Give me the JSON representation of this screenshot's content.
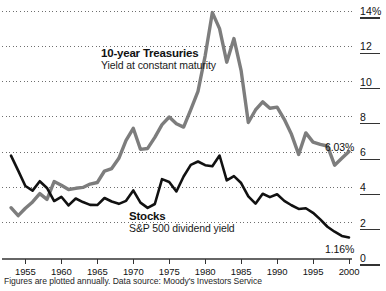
{
  "chart_data": {
    "type": "line",
    "title": "",
    "subtitle": "",
    "xlabel": "",
    "ylabel": "",
    "xlim": [
      1953,
      2000
    ],
    "ylim": [
      0,
      14
    ],
    "grid": true,
    "grid_style": "dotted-horizontal",
    "legend_position": "inline-annotations",
    "x_ticks": [
      1955,
      1960,
      1965,
      1970,
      1975,
      1980,
      1985,
      1990,
      1995,
      2000
    ],
    "x_tick_labels": [
      "1955",
      "1960",
      "1965",
      "1970",
      "1975",
      "1980",
      "1985",
      "1990",
      "1995",
      "2000"
    ],
    "y_ticks": [
      0,
      2,
      4,
      6,
      8,
      10,
      12,
      14
    ],
    "y_tick_labels": [
      "0",
      "2",
      "4",
      "6",
      "8",
      "10",
      "12",
      "14%"
    ],
    "x": [
      1953,
      1954,
      1955,
      1956,
      1957,
      1958,
      1959,
      1960,
      1961,
      1962,
      1963,
      1964,
      1965,
      1966,
      1967,
      1968,
      1969,
      1970,
      1971,
      1972,
      1973,
      1974,
      1975,
      1976,
      1977,
      1978,
      1979,
      1980,
      1981,
      1982,
      1983,
      1984,
      1985,
      1986,
      1987,
      1988,
      1989,
      1990,
      1991,
      1992,
      1993,
      1994,
      1995,
      1996,
      1997,
      1998,
      1999,
      2000
    ],
    "series": [
      {
        "name": "10-year Treasuries",
        "description": "Yield at constant maturity",
        "color": "#7d7d7d",
        "line_width": 3.4,
        "values": [
          2.85,
          2.4,
          2.82,
          3.18,
          3.65,
          3.32,
          4.33,
          4.12,
          3.88,
          3.95,
          4.0,
          4.19,
          4.28,
          4.93,
          5.07,
          5.65,
          6.67,
          7.35,
          6.16,
          6.21,
          6.84,
          7.56,
          7.99,
          7.61,
          7.42,
          8.41,
          9.44,
          11.46,
          13.91,
          13.0,
          11.1,
          12.44,
          10.62,
          7.68,
          8.39,
          8.85,
          8.49,
          8.55,
          7.86,
          7.01,
          5.87,
          7.09,
          6.57,
          6.44,
          6.35,
          5.26,
          5.65,
          6.03
        ]
      },
      {
        "name": "Stocks",
        "description": "S&P 500 dividend yield",
        "color": "#111111",
        "line_width": 2.6,
        "values": [
          5.8,
          4.95,
          4.08,
          3.82,
          4.35,
          3.97,
          3.23,
          3.47,
          2.98,
          3.37,
          3.17,
          3.01,
          3.0,
          3.4,
          3.2,
          3.07,
          3.24,
          3.83,
          3.14,
          2.84,
          3.06,
          4.47,
          4.31,
          3.77,
          4.62,
          5.28,
          5.47,
          5.26,
          5.2,
          5.81,
          4.4,
          4.64,
          4.25,
          3.49,
          3.08,
          3.64,
          3.45,
          3.61,
          3.24,
          2.99,
          2.78,
          2.82,
          2.56,
          2.19,
          1.77,
          1.49,
          1.25,
          1.16
        ]
      }
    ],
    "annotations": [
      {
        "name": "treasuries-end-value",
        "text": "6.03%",
        "x": 2000,
        "y": 6.03
      },
      {
        "name": "stocks-end-value",
        "text": "1.16%",
        "x": 2000,
        "y": 1.16
      }
    ]
  },
  "labels": {
    "treasuries_title": "10-year Treasuries",
    "treasuries_subtitle": "Yield at constant maturity",
    "stocks_title": "Stocks",
    "stocks_subtitle": "S&P 500 dividend yield",
    "treasuries_end": "6.03%",
    "stocks_end": "1.16%"
  },
  "axis": {
    "y_labels": [
      "14%",
      "12",
      "10",
      "8",
      "6",
      "4",
      "2",
      "0"
    ],
    "x_labels": [
      "1955",
      "1960",
      "1965",
      "1970",
      "1975",
      "1980",
      "1985",
      "1990",
      "1995",
      "2000"
    ]
  },
  "footnote": {
    "text": "Figures are plotted annually.  Data source: Moody's Investors Service"
  },
  "colors": {
    "treasuries": "#7d7d7d",
    "stocks": "#111111",
    "grid": "#6e6e6e",
    "axis": "#333333",
    "background": "#ffffff"
  }
}
